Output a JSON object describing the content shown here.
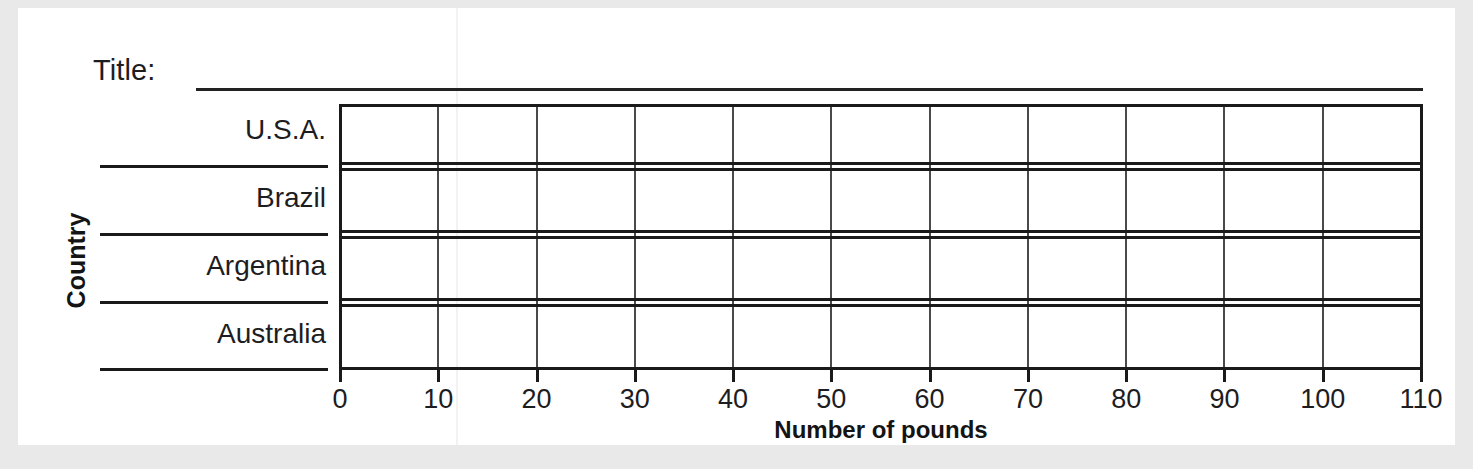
{
  "worksheet": {
    "title_prompt": "Title:",
    "title_value": ""
  },
  "axes": {
    "y_title": "Country",
    "x_title": "Number of pounds"
  },
  "chart_data": {
    "type": "bar",
    "orientation": "horizontal",
    "title": "",
    "xlabel": "Number of pounds",
    "ylabel": "Country",
    "categories": [
      "U.S.A.",
      "Brazil",
      "Argentina",
      "Australia"
    ],
    "values": [
      null,
      null,
      null,
      null
    ],
    "series": [
      {
        "name": "",
        "values": [
          null,
          null,
          null,
          null
        ]
      }
    ],
    "xlim": [
      0,
      110
    ],
    "xticks": [
      0,
      10,
      20,
      30,
      40,
      50,
      60,
      70,
      80,
      90,
      100,
      110
    ],
    "xtick_labels": [
      "0",
      "10",
      "20",
      "30",
      "40",
      "50",
      "60",
      "70",
      "80",
      "90",
      "100",
      "110"
    ],
    "grid": true,
    "grid_axis": "x",
    "legend": false,
    "blank_template": true,
    "note": "Empty bar-graph worksheet: axes and gridlines drawn, no bars plotted."
  },
  "colors": {
    "page": "#ffffff",
    "surround": "#e9e9ea",
    "ink": "#1a1a1a",
    "gridline": "#4a4a4a"
  }
}
